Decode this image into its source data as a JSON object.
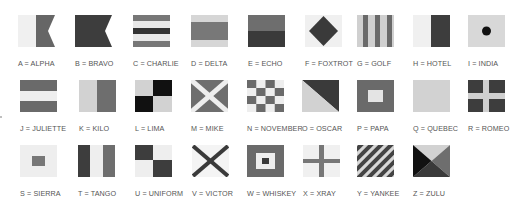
{
  "colors": {
    "light": "#ececec",
    "mid": "#d2d2d2",
    "gray": "#7a7a7a",
    "dark": "#4a4a4a",
    "black": "#111111"
  },
  "flags": [
    {
      "letter": "A",
      "word": "ALPHA",
      "label": "A = ALPHA",
      "icon": "flag-alpha-icon"
    },
    {
      "letter": "B",
      "word": "BRAVO",
      "label": "B = BRAVO",
      "icon": "flag-bravo-icon"
    },
    {
      "letter": "C",
      "word": "CHARLIE",
      "label": "C = CHARLIE",
      "icon": "flag-charlie-icon"
    },
    {
      "letter": "D",
      "word": "DELTA",
      "label": "D = DELTA",
      "icon": "flag-delta-icon"
    },
    {
      "letter": "E",
      "word": "ECHO",
      "label": "E = ECHO",
      "icon": "flag-echo-icon"
    },
    {
      "letter": "F",
      "word": "FOXTROT",
      "label": "F = FOXTROT",
      "icon": "flag-foxtrot-icon"
    },
    {
      "letter": "G",
      "word": "GOLF",
      "label": "G = GOLF",
      "icon": "flag-golf-icon"
    },
    {
      "letter": "H",
      "word": "HOTEL",
      "label": "H = HOTEL",
      "icon": "flag-hotel-icon"
    },
    {
      "letter": "I",
      "word": "INDIA",
      "label": "I = INDIA",
      "icon": "flag-india-icon"
    },
    {
      "letter": "J",
      "word": "JULIETTE",
      "label": "J = JULIETTE",
      "icon": "flag-juliette-icon"
    },
    {
      "letter": "K",
      "word": "KILO",
      "label": "K = KILO",
      "icon": "flag-kilo-icon"
    },
    {
      "letter": "L",
      "word": "LIMA",
      "label": "L = LIMA",
      "icon": "flag-lima-icon"
    },
    {
      "letter": "M",
      "word": "MIKE",
      "label": "M = MIKE",
      "icon": "flag-mike-icon"
    },
    {
      "letter": "N",
      "word": "NOVEMBER",
      "label": "N = NOVEMBER",
      "icon": "flag-november-icon"
    },
    {
      "letter": "O",
      "word": "OSCAR",
      "label": "O = OSCAR",
      "icon": "flag-oscar-icon"
    },
    {
      "letter": "P",
      "word": "PAPA",
      "label": "P = PAPA",
      "icon": "flag-papa-icon"
    },
    {
      "letter": "Q",
      "word": "QUEBEC",
      "label": "Q = QUEBEC",
      "icon": "flag-quebec-icon"
    },
    {
      "letter": "R",
      "word": "ROMEO",
      "label": "R = ROMEO",
      "icon": "flag-romeo-icon"
    },
    {
      "letter": "S",
      "word": "SIERRA",
      "label": "S = SIERRA",
      "icon": "flag-sierra-icon"
    },
    {
      "letter": "T",
      "word": "TANGO",
      "label": "T = TANGO",
      "icon": "flag-tango-icon"
    },
    {
      "letter": "U",
      "word": "UNIFORM",
      "label": "U = UNIFORM",
      "icon": "flag-uniform-icon"
    },
    {
      "letter": "V",
      "word": "VICTOR",
      "label": "V = VICTOR",
      "icon": "flag-victor-icon"
    },
    {
      "letter": "W",
      "word": "WHISKEY",
      "label": "W = WHISKEY",
      "icon": "flag-whiskey-icon"
    },
    {
      "letter": "X",
      "word": "XRAY",
      "label": "X = XRAY",
      "icon": "flag-xray-icon"
    },
    {
      "letter": "Y",
      "word": "YANKEE",
      "label": "Y = YANKEE",
      "icon": "flag-yankee-icon"
    },
    {
      "letter": "Z",
      "word": "ZULU",
      "label": "Z = ZULU",
      "icon": "flag-zulu-icon"
    }
  ]
}
